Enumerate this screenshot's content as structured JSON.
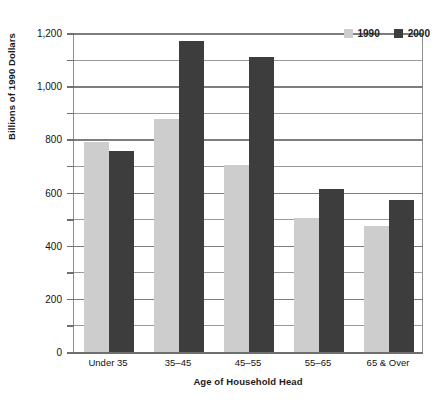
{
  "chart_data": {
    "type": "bar",
    "title": "",
    "subtitle": "",
    "xlabel": "Age of Household Head",
    "ylabel": "Billions of 1990 Dollars",
    "categories": [
      "Under 35",
      "35–45",
      "45–55",
      "55–65",
      "65 & Over"
    ],
    "series": [
      {
        "name": "1990",
        "color": "#cdcdcd",
        "values": [
          790,
          875,
          705,
          503,
          475
        ]
      },
      {
        "name": "2000",
        "color": "#3d3d3d",
        "values": [
          755,
          1170,
          1110,
          615,
          570
        ]
      }
    ],
    "ylim": [
      0,
      1200
    ],
    "ytick_values": [
      0,
      200,
      400,
      600,
      800,
      1000,
      1200
    ],
    "ytick_labels": [
      "0",
      "200",
      "400",
      "600",
      "800",
      "1,000",
      "1,200"
    ],
    "minor_tick_values": [
      100,
      300,
      500,
      700,
      900,
      1100
    ],
    "grid": true,
    "grid_axis": "y",
    "legend_position": "top-right",
    "legend_entries": [
      "1990",
      "2000"
    ]
  },
  "axes": {
    "y_title": "Billions of 1990 Dollars",
    "x_title": "Age of Household Head"
  },
  "legend": {
    "items": [
      {
        "label": "1990"
      },
      {
        "label": "2000"
      }
    ]
  }
}
